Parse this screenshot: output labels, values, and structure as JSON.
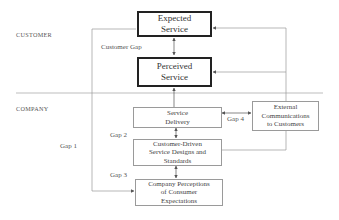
{
  "sections": {
    "customer_label": "CUSTOMER",
    "company_label": "COMPANY"
  },
  "boxes": {
    "expected_service": "Expected\nService",
    "perceived_service": "Perceived\nService",
    "service_delivery": "Service\nDelivery",
    "customer_driven": "Customer-Driven\nService Designs and\nStandards",
    "company_perceptions": "Company Perceptions\nof Consumer\nExpectations",
    "external_communications": "External\nCommunications\nto Customers"
  },
  "gaps": {
    "customer_gap": "Customer Gap",
    "gap1": "Gap 1",
    "gap2": "Gap 2",
    "gap3": "Gap 3",
    "gap4": "Gap 4"
  },
  "colors": {
    "thick_border": "#222222",
    "thin_border": "#9a9a9a",
    "line": "#8a8a8a",
    "text": "#444444"
  }
}
